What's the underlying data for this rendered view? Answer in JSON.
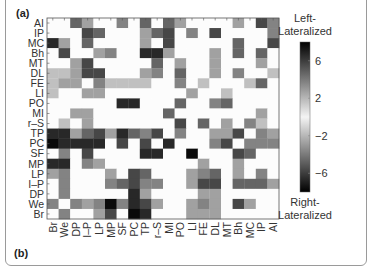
{
  "figure": {
    "panel_label": "(a)",
    "next_panel_label": "(b)"
  },
  "chart_data": {
    "type": "heatmap",
    "title": "",
    "xlabel": "",
    "ylabel": "",
    "row_labels": [
      "AI",
      "IP",
      "MC",
      "Bh",
      "MT",
      "DL",
      "FE",
      "LI",
      "PO",
      "MI",
      "r–S",
      "TP",
      "PC",
      "SF",
      "MP",
      "LP",
      "I–P",
      "DP",
      "We",
      "Br"
    ],
    "col_labels": [
      "Br",
      "We",
      "DP",
      "I–P",
      "LP",
      "MP",
      "SF",
      "PC",
      "TP",
      "r–S",
      "MI",
      "PO",
      "LI",
      "FE",
      "DL",
      "MT",
      "Bh",
      "MC",
      "IP",
      "AI"
    ],
    "colorbar": {
      "top_label": "Left-\nLateralized",
      "bottom_label": "Right-\nLateralized",
      "ticks": [
        6,
        2,
        -2,
        -6
      ],
      "range": [
        -8,
        8
      ]
    },
    "values": [
      [
        0,
        0,
        5,
        3,
        0,
        0,
        4,
        0,
        5,
        0,
        5,
        3,
        0,
        0,
        0,
        0,
        3,
        0,
        6,
        4
      ],
      [
        0,
        0,
        0,
        6,
        5,
        0,
        0,
        0,
        3,
        5,
        6,
        0,
        4,
        0,
        6,
        0,
        0,
        0,
        0,
        4
      ],
      [
        7,
        3,
        0,
        5,
        0,
        0,
        0,
        0,
        3,
        0,
        6,
        0,
        0,
        0,
        0,
        0,
        5,
        0,
        0,
        6
      ],
      [
        0,
        6,
        0,
        0,
        3,
        4,
        0,
        0,
        7,
        7,
        3,
        0,
        0,
        0,
        3,
        0,
        5,
        0,
        5,
        0
      ],
      [
        0,
        0,
        3,
        6,
        0,
        0,
        0,
        0,
        0,
        5,
        0,
        3,
        0,
        0,
        3,
        0,
        0,
        0,
        3,
        0
      ],
      [
        2,
        2,
        3,
        6,
        6,
        0,
        0,
        0,
        3,
        4,
        0,
        5,
        0,
        0,
        3,
        0,
        4,
        0,
        0,
        2
      ],
      [
        2,
        3,
        3,
        0,
        4,
        2,
        2,
        2,
        2,
        0,
        0,
        4,
        0,
        2,
        0,
        0,
        0,
        2,
        5,
        0
      ],
      [
        2,
        0,
        0,
        3,
        3,
        0,
        0,
        0,
        0,
        0,
        0,
        0,
        3,
        0,
        0,
        2,
        0,
        0,
        0,
        0
      ],
      [
        0,
        0,
        0,
        0,
        0,
        0,
        7,
        7,
        0,
        0,
        0,
        5,
        0,
        0,
        4,
        5,
        0,
        0,
        0,
        0
      ],
      [
        0,
        0,
        3,
        3,
        0,
        0,
        0,
        0,
        0,
        0,
        5,
        0,
        0,
        0,
        0,
        0,
        0,
        0,
        3,
        0
      ],
      [
        0,
        2,
        0,
        3,
        0,
        0,
        0,
        0,
        0,
        0,
        0,
        6,
        0,
        5,
        0,
        3,
        0,
        4,
        2,
        0
      ],
      [
        -7,
        -7,
        -3,
        -5,
        -6,
        -3,
        -7,
        -5,
        -4,
        -6,
        0,
        -4,
        0,
        0,
        -3,
        -3,
        -6,
        0,
        -4,
        -3
      ],
      [
        -8,
        -7,
        -7,
        -7,
        -7,
        0,
        -6,
        0,
        -6,
        0,
        -7,
        0,
        0,
        0,
        -4,
        -6,
        0,
        -4,
        -4,
        -4
      ],
      [
        0,
        -4,
        0,
        -6,
        0,
        0,
        0,
        0,
        -7,
        -7,
        0,
        0,
        -8,
        0,
        0,
        0,
        -6,
        -5,
        0,
        0
      ],
      [
        -7,
        -7,
        0,
        -4,
        -3,
        0,
        0,
        0,
        0,
        0,
        0,
        0,
        0,
        -3,
        0,
        0,
        -3,
        0,
        0,
        0
      ],
      [
        -3,
        -4,
        0,
        0,
        0,
        -3,
        0,
        -6,
        -5,
        0,
        0,
        0,
        -3,
        -4,
        -5,
        0,
        -3,
        0,
        -4,
        0
      ],
      [
        0,
        -4,
        0,
        0,
        0,
        -4,
        -5,
        -6,
        -4,
        -4,
        0,
        0,
        -3,
        -6,
        -6,
        0,
        -5,
        -5,
        -5,
        -3
      ],
      [
        0,
        -4,
        0,
        0,
        0,
        0,
        0,
        -7,
        -3,
        0,
        0,
        0,
        0,
        -3,
        -3,
        0,
        0,
        0,
        0,
        0
      ],
      [
        -4,
        0,
        -4,
        -3,
        -4,
        -8,
        -4,
        -7,
        -6,
        -3,
        0,
        0,
        -3,
        -4,
        -3,
        0,
        -6,
        -3,
        0,
        0
      ],
      [
        0,
        -4,
        0,
        0,
        -3,
        -6,
        0,
        -8,
        -7,
        0,
        0,
        0,
        -3,
        -3,
        -3,
        0,
        0,
        0,
        0,
        0
      ]
    ]
  }
}
